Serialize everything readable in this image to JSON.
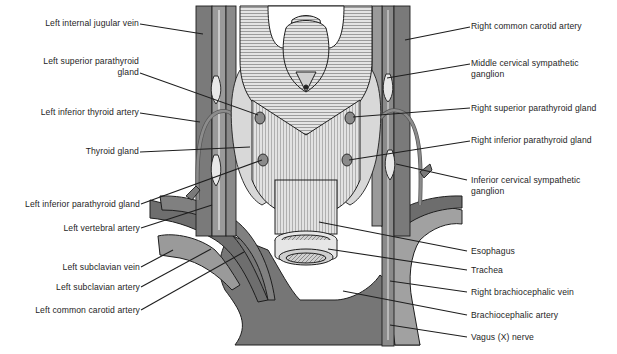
{
  "figure": {
    "colors": {
      "vessel_dark": "#6f6f6f",
      "vessel_mid": "#8c8c8c",
      "vessel_light": "#a6a6a6",
      "gland": "#d9d9d9",
      "muscle": "#e6e6e6",
      "line": "#1e1e1e",
      "background": "#ffffff"
    }
  },
  "labels_left": [
    {
      "text": "Left internal jugular vein"
    },
    {
      "text": "Left superior parathyroid",
      "text2": "gland"
    },
    {
      "text": "Left inferior thyroid artery"
    },
    {
      "text": "Thyroid gland"
    },
    {
      "text": "Left inferior parathyroid gland"
    },
    {
      "text": "Left vertebral artery"
    },
    {
      "text": "Left subclavian vein"
    },
    {
      "text": "Left subclavian artery"
    },
    {
      "text": "Left common carotid artery"
    }
  ],
  "labels_right": [
    {
      "text": "Right common carotid artery"
    },
    {
      "text": "Middle cervical sympathetic",
      "text2": "ganglion"
    },
    {
      "text": "Right superior parathyroid gland"
    },
    {
      "text": "Right inferior parathyroid gland"
    },
    {
      "text": "Inferior cervical sympathetic",
      "text2": "ganglion"
    },
    {
      "text": "Esophagus"
    },
    {
      "text": "Trachea"
    },
    {
      "text": "Right brachiocephalic vein"
    },
    {
      "text": "Brachiocephalic artery"
    },
    {
      "text": "Vagus (X) nerve"
    }
  ]
}
